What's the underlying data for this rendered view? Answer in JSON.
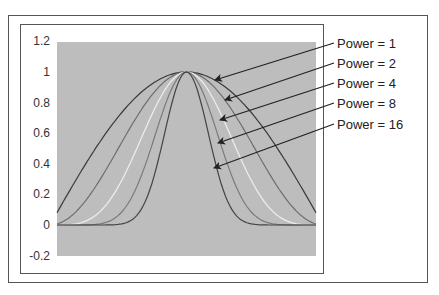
{
  "chart_data": {
    "type": "line",
    "title": "",
    "xlabel": "",
    "ylabel": "",
    "ylim": [
      -0.2,
      1.2
    ],
    "yticks": [
      "1.2",
      "1",
      "0.8",
      "0.6",
      "0.4",
      "0.2",
      "0",
      "-0.2"
    ],
    "ytick_values": [
      1.2,
      1,
      0.8,
      0.6,
      0.4,
      0.2,
      0,
      -0.2
    ],
    "grid": false,
    "legend_position": "right, with arrows pointing to curves",
    "function": "y = cos(x)^power",
    "x_range": [
      -1.49,
      1.49
    ],
    "x": [
      -1.49,
      -1.242,
      -0.993,
      -0.745,
      -0.497,
      -0.248,
      0,
      0.248,
      0.497,
      0.745,
      0.993,
      1.242,
      1.49
    ],
    "series": [
      {
        "name": "Power = 1",
        "power": 1,
        "color": "#3a3a3a",
        "values": [
          0.081,
          0.322,
          0.546,
          0.735,
          0.879,
          0.969,
          1,
          0.969,
          0.879,
          0.735,
          0.546,
          0.322,
          0.081
        ]
      },
      {
        "name": "Power = 2",
        "power": 2,
        "color": "#6e6e6e",
        "values": [
          0.007,
          0.104,
          0.298,
          0.54,
          0.773,
          0.939,
          1,
          0.939,
          0.773,
          0.54,
          0.298,
          0.104,
          0.007
        ]
      },
      {
        "name": "Power = 4",
        "power": 4,
        "color": "#ececec",
        "values": [
          0.0,
          0.011,
          0.089,
          0.292,
          0.597,
          0.882,
          1,
          0.882,
          0.597,
          0.292,
          0.089,
          0.011,
          0.0
        ]
      },
      {
        "name": "Power = 8",
        "power": 8,
        "color": "#7a7a7a",
        "values": [
          0.0,
          0.0,
          0.008,
          0.085,
          0.357,
          0.778,
          1,
          0.778,
          0.357,
          0.085,
          0.008,
          0.0,
          0.0
        ]
      },
      {
        "name": "Power = 16",
        "power": 16,
        "color": "#444444",
        "values": [
          0.0,
          0.0,
          0.0,
          0.007,
          0.127,
          0.605,
          1,
          0.605,
          0.127,
          0.007,
          0.0,
          0.0,
          0.0
        ]
      }
    ]
  },
  "legend": [
    {
      "label": "Power = 1",
      "y": 43,
      "tip": [
        215,
        80
      ]
    },
    {
      "label": "Power = 2",
      "y": 63,
      "tip": [
        225,
        100
      ]
    },
    {
      "label": "Power = 4",
      "y": 83,
      "tip": [
        220,
        120
      ]
    },
    {
      "label": "Power = 8",
      "y": 103,
      "tip": [
        218,
        143
      ]
    },
    {
      "label": "Power = 16",
      "y": 124,
      "tip": [
        214,
        168
      ]
    }
  ],
  "colors": {
    "plot_background": "#bdbdbd",
    "frame": "#555555",
    "arrow": "#222222"
  }
}
